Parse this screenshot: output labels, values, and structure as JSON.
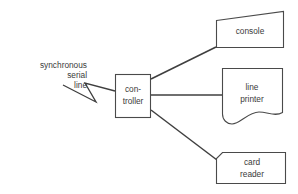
{
  "diagram": {
    "background_color": "#ffffff",
    "stroke_color": "#4a4a4a",
    "connector_color": "#3f3f3f",
    "text_color": "#3a3a3a",
    "annotation": {
      "name": "synchronous-serial-line-label",
      "line1": "synchronous",
      "line2": "serial",
      "line3": "line",
      "full_text": "synchronous serial line",
      "align": "right",
      "pointer": "zigzag-arrow-to-controller"
    },
    "nodes": {
      "controller": {
        "label_line1": "con-",
        "label_line2": "troller",
        "full_text": "controller",
        "shape": "rectangle"
      },
      "console": {
        "label": "console",
        "shape": "quadrilateral-slanted-top"
      },
      "line_printer": {
        "label_line1": "line",
        "label_line2": "printer",
        "full_text": "line printer",
        "shape": "rectangle-wavy-bottom"
      },
      "card_reader": {
        "label_line1": "card",
        "label_line2": "reader",
        "full_text": "card reader",
        "shape": "rectangle-chamfered-top-left"
      }
    },
    "connections": [
      {
        "from": "controller",
        "to": "console",
        "style": "diagonal-up-right"
      },
      {
        "from": "controller",
        "to": "line_printer",
        "style": "horizontal"
      },
      {
        "from": "controller",
        "to": "card_reader",
        "style": "diagonal-down-right"
      },
      {
        "from": "synchronous-serial-line-label",
        "to": "controller",
        "style": "zigzag"
      }
    ]
  }
}
